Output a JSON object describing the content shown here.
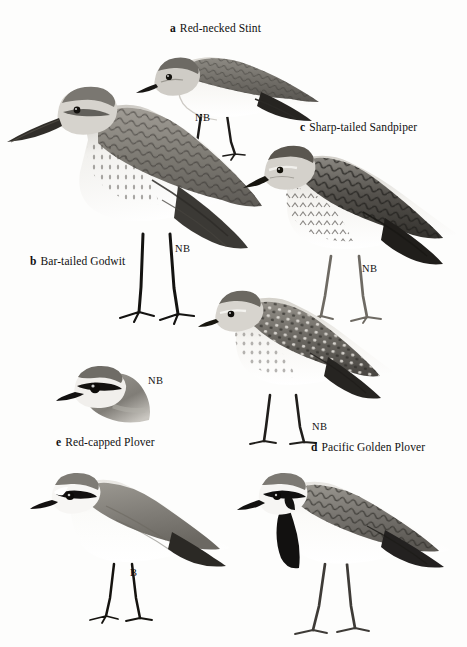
{
  "plate": {
    "background_color": "#fdfdfc",
    "style": "field-guide bird illustration plate, greyscale halftone",
    "figure_count": 7
  },
  "captions": [
    {
      "letter": "a",
      "name": "Red-necked Stint",
      "x": 170,
      "y": 22
    },
    {
      "letter": "c",
      "name": "Sharp-tailed Sandpiper",
      "x": 300,
      "y": 121
    },
    {
      "letter": "b",
      "name": "Bar-tailed Godwit",
      "x": 30,
      "y": 255
    },
    {
      "letter": "d",
      "name": "Pacific Golden Plover",
      "x": 311,
      "y": 441
    },
    {
      "letter": "e",
      "name": "Red-capped Plover",
      "x": 56,
      "y": 436
    }
  ],
  "plumage_labels": [
    {
      "text": "NB",
      "x": 195,
      "y": 112,
      "refers_to": "Red-necked Stint"
    },
    {
      "text": "NB",
      "x": 175,
      "y": 243,
      "refers_to": "Bar-tailed Godwit"
    },
    {
      "text": "NB",
      "x": 362,
      "y": 263,
      "refers_to": "Sharp-tailed Sandpiper"
    },
    {
      "text": "NB",
      "x": 312,
      "y": 421,
      "refers_to": "Pacific Golden Plover"
    },
    {
      "text": "NB",
      "x": 148,
      "y": 375,
      "refers_to": "Red-capped Plover head"
    },
    {
      "text": "B",
      "x": 130,
      "y": 567,
      "refers_to": "Red-capped Plover breeding"
    }
  ],
  "figures": [
    {
      "id": "red-necked-stint",
      "label_letter": "a",
      "common_name": "Red-necked Stint",
      "plumage": "NB",
      "pose": "standing, facing left, full body",
      "traits": [
        "small sandpiper",
        "short straight black bill",
        "grey-brown scaled upperparts",
        "white underparts",
        "dark legs"
      ]
    },
    {
      "id": "bar-tailed-godwit",
      "label_letter": "b",
      "common_name": "Bar-tailed Godwit",
      "plumage": "NB",
      "pose": "standing, facing left, full body",
      "traits": [
        "large wader",
        "very long slightly upturned bill",
        "streaked breast",
        "scalloped grey-brown back",
        "long dark legs"
      ]
    },
    {
      "id": "sharp-tailed-sandpiper",
      "label_letter": "c",
      "common_name": "Sharp-tailed Sandpiper",
      "plumage": "NB",
      "pose": "standing, facing left, full body",
      "traits": [
        "rufous-toned cap",
        "bold pale supercilium",
        "heavily streaked breast",
        "dark scaled upperparts",
        "pale legs"
      ]
    },
    {
      "id": "pacific-golden-plover",
      "label_letter": "d",
      "common_name": "Pacific Golden Plover",
      "plumage": "NB",
      "pose": "standing, facing left, full body",
      "traits": [
        "short stout black bill",
        "pale supercilium",
        "spangled gold-grey upperparts",
        "whitish belly",
        "grey legs"
      ]
    },
    {
      "id": "red-capped-plover-head",
      "label_letter": "e",
      "common_name": "Red-capped Plover",
      "plumage": "NB",
      "pose": "head-and-neck vignette, facing left",
      "traits": [
        "dark eye stripe",
        "pale forehead",
        "short black bill",
        "plain grey crown"
      ]
    },
    {
      "id": "red-capped-plover-breeding",
      "label_letter": "e",
      "common_name": "Red-capped Plover",
      "plumage": "B",
      "pose": "standing, facing left, full body",
      "traits": [
        "white underparts",
        "grey-brown upperparts",
        "black eye mask",
        "white forehead",
        "dark thin legs"
      ]
    },
    {
      "id": "banded-plover",
      "label_letter": "",
      "common_name": "",
      "plumage": "",
      "pose": "standing, facing left, full body",
      "traits": [
        "bold black breast band",
        "black head stripe",
        "scaled brown upperparts",
        "white underparts",
        "long grey legs"
      ]
    }
  ]
}
